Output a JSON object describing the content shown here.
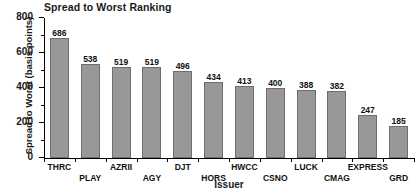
{
  "chart_data": {
    "type": "bar",
    "title": "Spread to Worst Ranking",
    "xlabel": "Issuer",
    "ylabel": "Spread to Worst (basis points)",
    "categories": [
      "THRC",
      "PLAY",
      "AZRII",
      "AGY",
      "DJT",
      "HORS",
      "HWCC",
      "CSNO",
      "LUCK",
      "CMAG",
      "EXPRESS",
      "GRD"
    ],
    "values": [
      686,
      538,
      519,
      519,
      496,
      434,
      413,
      400,
      388,
      382,
      247,
      185
    ],
    "ylim": [
      0,
      800
    ],
    "ytick_labels": [
      "0",
      "200",
      "400",
      "600",
      "800"
    ],
    "ytick_values": [
      0,
      200,
      400,
      600,
      800
    ],
    "yminor_values": [
      100,
      300,
      500,
      700
    ],
    "grid": false,
    "legend": false,
    "bar_color": "#989898",
    "bar_edge_color": "#6e6e6e",
    "axis_color": "#000000",
    "label_stagger": [
      0,
      1,
      0,
      1,
      0,
      1,
      0,
      1,
      0,
      1,
      0,
      1
    ]
  }
}
